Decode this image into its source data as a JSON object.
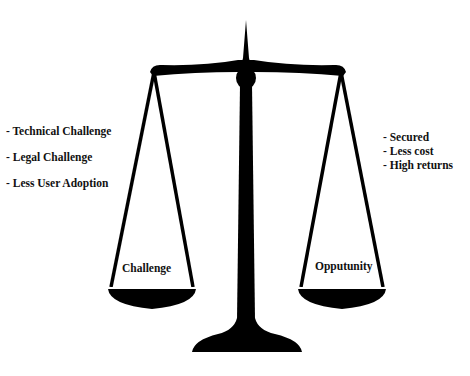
{
  "diagram": {
    "type": "balance-scale",
    "left_side": {
      "pan_label": "Challenge",
      "items": [
        "- Technical Challenge",
        "- Legal Challenge",
        "- Less User Adoption"
      ]
    },
    "right_side": {
      "pan_label": "Opputunity",
      "items": [
        "- Secured",
        "- Less cost",
        "- High returns"
      ]
    },
    "colors": {
      "scale": "#000000",
      "pan_fill": "#ffffff",
      "background": "#ffffff",
      "text": "#111111"
    }
  }
}
